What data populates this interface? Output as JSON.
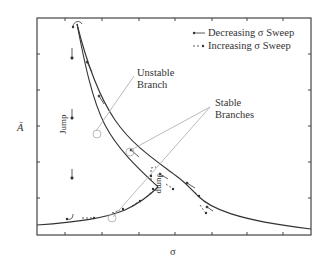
{
  "figure": {
    "y_axis_label": "Ā",
    "x_axis_label": "σ",
    "legend": {
      "decreasing": "Decreasing σ Sweep",
      "increasing": "Increasing σ Sweep"
    },
    "annotations": {
      "unstable_line1": "Unstable",
      "unstable_line2": "Branch",
      "stable_line1": "Stable",
      "stable_line2": "Branches",
      "jump_left": "Jump",
      "jump_right": "Jump"
    },
    "colors": {
      "axis": "#444444",
      "curve": "#333333",
      "leader": "#aaaaaa"
    }
  }
}
